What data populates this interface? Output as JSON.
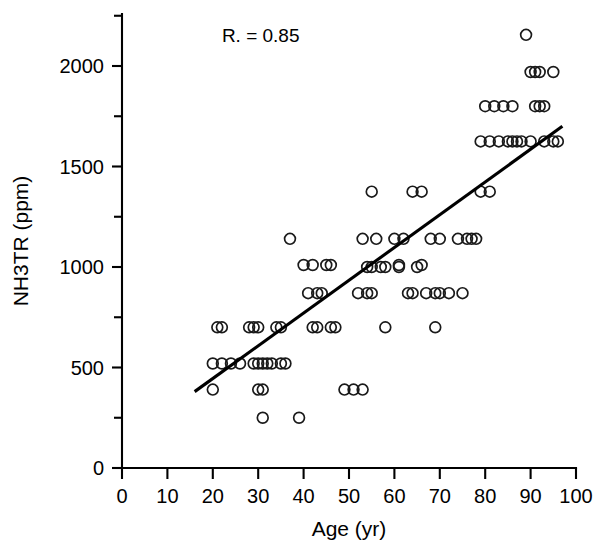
{
  "chart_data": {
    "type": "scatter",
    "title": "",
    "xlabel": "Age (yr)",
    "ylabel": "NH3TR (ppm)",
    "xlim": [
      0,
      100
    ],
    "ylim": [
      0,
      2250
    ],
    "xticks": [
      0,
      10,
      20,
      30,
      40,
      50,
      60,
      70,
      80,
      90,
      100
    ],
    "xtick_labels": [
      "0",
      "10",
      "20",
      "30",
      "40",
      "50",
      "60",
      "70",
      "80",
      "90",
      "100"
    ],
    "yticks": [
      0,
      500,
      1000,
      1500,
      2000
    ],
    "ytick_labels": [
      "0",
      "500",
      "1000",
      "1500",
      "2000"
    ],
    "y_minor_ticks": [
      250,
      750,
      1250,
      1750,
      2250
    ],
    "grid": false,
    "legend": null,
    "annotations": [
      {
        "name": "correlation",
        "text": "R. = 0.85",
        "x": 22,
        "y": 2120
      }
    ],
    "marker": {
      "shape": "circle-open",
      "radius_px": 5.4,
      "stroke": "#1a1a1a"
    },
    "fit_line": {
      "name": "regression-line",
      "x_start": 16,
      "y_start": 380,
      "x_end": 97,
      "y_end": 1700,
      "slope": 16.3,
      "intercept": 119,
      "color": "#000000"
    },
    "points": [
      [
        20,
        520
      ],
      [
        22,
        520
      ],
      [
        24,
        520
      ],
      [
        26,
        520
      ],
      [
        29,
        520
      ],
      [
        30,
        520
      ],
      [
        31,
        520
      ],
      [
        32,
        520
      ],
      [
        33,
        520
      ],
      [
        35,
        520
      ],
      [
        36,
        520
      ],
      [
        21,
        700
      ],
      [
        22,
        700
      ],
      [
        28,
        700
      ],
      [
        29,
        700
      ],
      [
        30,
        700
      ],
      [
        34,
        700
      ],
      [
        35,
        700
      ],
      [
        20,
        390
      ],
      [
        30,
        390
      ],
      [
        31,
        390
      ],
      [
        31,
        250
      ],
      [
        39,
        250
      ],
      [
        37,
        1140
      ],
      [
        40,
        1010
      ],
      [
        42,
        1010
      ],
      [
        45,
        1010
      ],
      [
        46,
        1010
      ],
      [
        41,
        870
      ],
      [
        43,
        870
      ],
      [
        44,
        870
      ],
      [
        42,
        700
      ],
      [
        43,
        700
      ],
      [
        46,
        700
      ],
      [
        47,
        700
      ],
      [
        49,
        390
      ],
      [
        51,
        390
      ],
      [
        53,
        390
      ],
      [
        52,
        870
      ],
      [
        54,
        870
      ],
      [
        55,
        870
      ],
      [
        54,
        1000
      ],
      [
        55,
        1000
      ],
      [
        55,
        1375
      ],
      [
        53,
        1140
      ],
      [
        56,
        1140
      ],
      [
        57,
        1000
      ],
      [
        58,
        1000
      ],
      [
        58,
        700
      ],
      [
        60,
        1140
      ],
      [
        62,
        1140
      ],
      [
        61,
        1010
      ],
      [
        61,
        1000
      ],
      [
        63,
        870
      ],
      [
        64,
        870
      ],
      [
        64,
        1375
      ],
      [
        66,
        1375
      ],
      [
        65,
        1000
      ],
      [
        66,
        1010
      ],
      [
        67,
        870
      ],
      [
        69,
        870
      ],
      [
        70,
        870
      ],
      [
        68,
        1140
      ],
      [
        70,
        1140
      ],
      [
        69,
        700
      ],
      [
        72,
        870
      ],
      [
        75,
        870
      ],
      [
        74,
        1140
      ],
      [
        76,
        1140
      ],
      [
        77,
        1140
      ],
      [
        78,
        1140
      ],
      [
        79,
        1375
      ],
      [
        81,
        1375
      ],
      [
        79,
        1625
      ],
      [
        81,
        1625
      ],
      [
        83,
        1625
      ],
      [
        80,
        1800
      ],
      [
        82,
        1800
      ],
      [
        84,
        1800
      ],
      [
        85,
        1625
      ],
      [
        86,
        1625
      ],
      [
        87,
        1625
      ],
      [
        86,
        1800
      ],
      [
        88,
        1625
      ],
      [
        90,
        1625
      ],
      [
        89,
        2155
      ],
      [
        90,
        1970
      ],
      [
        91,
        1970
      ],
      [
        92,
        1970
      ],
      [
        91,
        1800
      ],
      [
        92,
        1800
      ],
      [
        93,
        1800
      ],
      [
        95,
        1970
      ],
      [
        93,
        1625
      ],
      [
        95,
        1625
      ],
      [
        96,
        1625
      ]
    ]
  },
  "axes": {
    "x_axis_name": "x-axis",
    "y_axis_name": "y-axis"
  }
}
